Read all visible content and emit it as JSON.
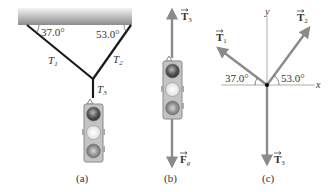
{
  "panels": {
    "a": {
      "caption": "(a)",
      "angle_left": "37.0°",
      "angle_right": "53.0°",
      "rope_labels": {
        "t1": "T",
        "t1_sub": "1",
        "t2": "T",
        "t2_sub": "2",
        "t3": "T",
        "t3_sub": "3"
      }
    },
    "b": {
      "caption": "(b)",
      "force_up": {
        "symbol": "T",
        "sub": "3"
      },
      "force_down": {
        "symbol": "F",
        "sub": "g"
      }
    },
    "c": {
      "caption": "(c)",
      "axis_x": "x",
      "axis_y": "y",
      "angle_left": "37.0°",
      "angle_right": "53.0°",
      "vec_t1": {
        "symbol": "T",
        "sub": "1"
      },
      "vec_t2": {
        "symbol": "T",
        "sub": "2"
      },
      "vec_t3": {
        "symbol": "T",
        "sub": "3"
      }
    }
  },
  "colors": {
    "rope": "#1a1a1a",
    "vector": "#8a8a8a",
    "ceiling_top": "#f2f2f2",
    "ceiling_bottom": "#8d8d8d",
    "axis": "#888888"
  }
}
